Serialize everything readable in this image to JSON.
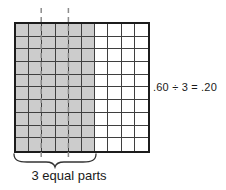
{
  "figure": {
    "title_semantics": "hundredths-grid division model",
    "grid": {
      "rows": 10,
      "cols": 10,
      "shaded_cols": 6,
      "parts": 3,
      "shaded_fraction": 0.6,
      "part_fraction": 0.2,
      "shaded_color": "#cccccc",
      "line_color": "#3f3f3f",
      "border_color": "#1c1c1c",
      "dash_color": "#8c8c8c"
    },
    "equation": ".60 ÷ 3 = .20",
    "caption": "3 equal parts"
  }
}
